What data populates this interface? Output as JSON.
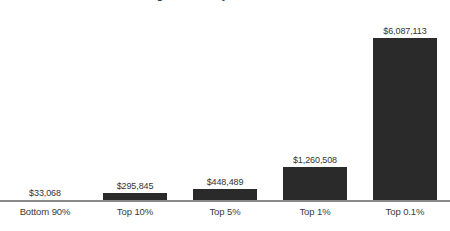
{
  "chart_data": {
    "type": "bar",
    "title": "Average Income by Wealth Percentile",
    "title_clipped": true,
    "xlabel": "",
    "ylabel": "",
    "categories": [
      "Bottom 90%",
      "Top 10%",
      "Top 5%",
      "Top 1%",
      "Top 0.1%"
    ],
    "values": [
      33068,
      295845,
      448489,
      1260508,
      6087113
    ],
    "value_labels": [
      "$33,068",
      "$295,845",
      "$448,489",
      "$1,260,508",
      "$6,087,113"
    ],
    "ylim": [
      0,
      6087113
    ],
    "grid": false,
    "legend": false,
    "axis_line": true,
    "bar_color": "#2a2a2a",
    "background_color": "#ffffff",
    "text_color": "#343434",
    "axis_color": "#8a8a8a"
  }
}
